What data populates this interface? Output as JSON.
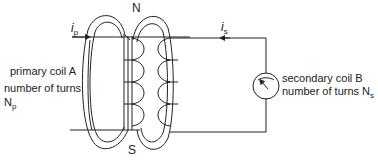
{
  "diagram": {
    "type": "transformer mutual induction schematic",
    "poles": {
      "north": "N",
      "south": "S"
    },
    "primary": {
      "current_label": "i",
      "current_sub": "p",
      "name": "primary coil A",
      "turns_label": "number of turns",
      "turns_symbol": "N",
      "turns_sub": "p"
    },
    "secondary": {
      "current_label": "i",
      "current_sub": "s",
      "name": "secondary coil B",
      "turns_label": "number of turns N",
      "turns_sub": "s",
      "meter": "galvanometer"
    },
    "colors": {
      "line": "#222222",
      "background": "#ffffff"
    }
  }
}
